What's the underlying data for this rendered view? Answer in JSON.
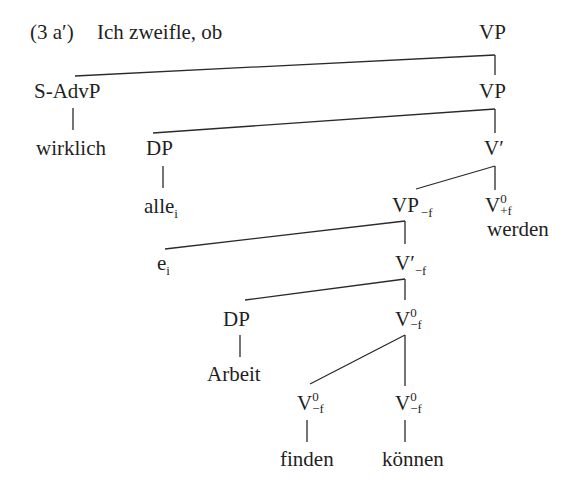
{
  "example": {
    "number": "(3 a′)",
    "lead_text": "Ich zweifle, ob"
  },
  "tree": {
    "nodes": {
      "root_vp": "VP",
      "s_advp": "S-AdvP",
      "vp2": "VP",
      "wirklich": "wirklich",
      "dp1": "DP",
      "vbar": "V′",
      "alle": "alle",
      "alle_index": "i",
      "vp_f": "VP",
      "vp_f_sub": "−f",
      "v0_plusf": "V",
      "v0_plusf_sup": "0",
      "v0_plusf_sub": "+f",
      "werden": "werden",
      "e": "e",
      "e_index": "i",
      "vbar_f": "V′",
      "vbar_f_sub": "−f",
      "dp2": "DP",
      "v0_f_mid": "V",
      "v0_f_mid_sup": "0",
      "v0_f_mid_sub": "−f",
      "arbeit": "Arbeit",
      "v0_f_left": "V",
      "v0_f_left_sup": "0",
      "v0_f_left_sub": "−f",
      "v0_f_right": "V",
      "v0_f_right_sup": "0",
      "v0_f_right_sub": "−f",
      "finden": "finden",
      "koennen": "können"
    }
  }
}
